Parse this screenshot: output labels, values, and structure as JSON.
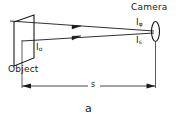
{
  "figure": {
    "caption": "a",
    "labels": {
      "camera": "Camera",
      "object": "Object",
      "intensity_object": "I",
      "intensity_object_sub": "o",
      "intensity_phi": "I",
      "intensity_phi_sub": "φ",
      "intensity_s": "I",
      "intensity_s_sub": "s",
      "distance": "s"
    },
    "colors": {
      "stroke": "#1a1a1a",
      "background": "#ffffff",
      "text": "#1a1a1a"
    },
    "elements": {
      "object_plane": "parallelogram",
      "camera_lens": "ellipse",
      "rays": 2,
      "ray_arrowheads": 2,
      "dimension_line": "double-arrow"
    }
  }
}
